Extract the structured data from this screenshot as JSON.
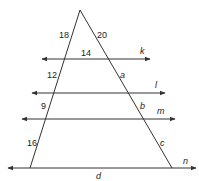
{
  "diagram": {
    "type": "triangle cut by parallel lines",
    "colors": {
      "line": "#333333",
      "text": "#222222",
      "background": "#ffffff"
    },
    "side_labels": {
      "left": [
        "18",
        "12",
        "9",
        "16"
      ],
      "right": [
        "20",
        "a",
        "b",
        "c"
      ]
    },
    "segment_labels": {
      "k_inside": "14",
      "base": "d"
    },
    "line_names": [
      "k",
      "l",
      "m",
      "n"
    ]
  }
}
